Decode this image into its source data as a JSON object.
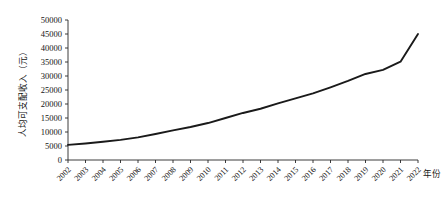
{
  "chart_data": {
    "type": "line",
    "title": "",
    "xlabel": "年份",
    "ylabel": "人均可支配收入（元）",
    "categories": [
      "2002",
      "2003",
      "2004",
      "2005",
      "2006",
      "2007",
      "2008",
      "2009",
      "2010",
      "2011",
      "2012",
      "2013",
      "2014",
      "2015",
      "2016",
      "2017",
      "2018",
      "2019",
      "2020",
      "2021",
      "2022"
    ],
    "series": [
      {
        "name": "人均可支配收入",
        "values": [
          5400,
          5900,
          6500,
          7200,
          8100,
          9300,
          10600,
          11800,
          13200,
          15000,
          16800,
          18300,
          20200,
          22000,
          23800,
          25970,
          28230,
          30730,
          32190,
          35130,
          45000
        ]
      }
    ],
    "ylim": [
      0,
      50000
    ],
    "ytick_values": [
      0,
      5000,
      10000,
      15000,
      20000,
      25000,
      30000,
      35000,
      40000,
      45000,
      50000
    ],
    "ytick_labels": [
      "0",
      "5000",
      "10000",
      "15000",
      "20000",
      "25000",
      "30000",
      "35000",
      "40000",
      "45000",
      "50000"
    ],
    "grid": false,
    "legend": "none",
    "line_color": "#1a1a1a",
    "axis_color": "#262626",
    "background": "#ffffff"
  },
  "layout": {
    "plot_left": 68,
    "plot_right": 418,
    "plot_top": 20,
    "plot_bottom": 160
  }
}
